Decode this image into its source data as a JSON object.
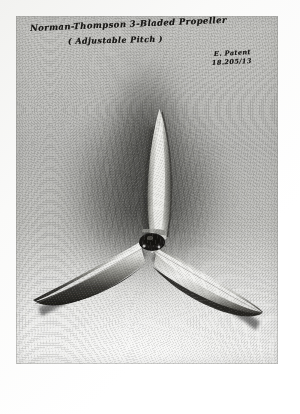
{
  "artifact": {
    "kind": "photographic-print-on-paper-mount",
    "orientation": "portrait"
  },
  "mount": {
    "background_color": "#fdfdfc",
    "margin_px": 16
  },
  "photo": {
    "left": 16,
    "top": 16,
    "width": 262,
    "height": 348,
    "tone": "black-and-white",
    "backdrop_light": "#f6f6f5",
    "backdrop_mid": "#c2c2bf",
    "shadow_dark": "#262624"
  },
  "annotations": {
    "title": "Norman-Thompson  3-Bladed Propeller",
    "subtitle": "( Adjustable Pitch )",
    "note_line1": "E. Patent",
    "note_line2": "18.205/13",
    "ink_color": "#181715"
  },
  "subject": {
    "name": "three-bladed adjustable-pitch propeller",
    "blade_count": 3,
    "hub": {
      "center_x": 150,
      "center_y": 238,
      "color": "#1b1a18"
    },
    "blades": [
      {
        "label": "upper-blade",
        "direction": "up",
        "tip_x": 152,
        "tip_y": 103,
        "highlight_color": "#e9e9e6",
        "shade_color": "#5d5d58"
      },
      {
        "label": "lower-left-blade",
        "direction": "down-left",
        "tip_x": 33,
        "tip_y": 306,
        "highlight_color": "#ededea",
        "shade_color": "#262522"
      },
      {
        "label": "lower-right-blade",
        "direction": "down-right",
        "tip_x": 256,
        "tip_y": 320,
        "highlight_color": "#f0f0ee",
        "shade_color": "#3a3934"
      }
    ]
  }
}
